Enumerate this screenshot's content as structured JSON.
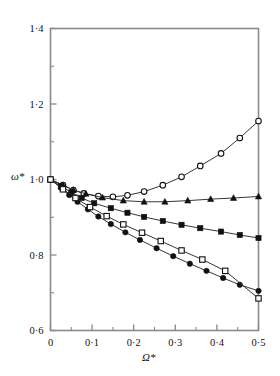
{
  "chart_data": {
    "type": "line",
    "title": "",
    "xlabel": "Ω*",
    "ylabel": "ω*",
    "xlim": [
      0,
      0.5
    ],
    "ylim": [
      0.6,
      1.4
    ],
    "grid": false,
    "legend": "none",
    "x_major_ticks": [
      "0",
      "0·1",
      "0·2",
      "0·3",
      "0·4",
      "0·5"
    ],
    "x_major_values": [
      0,
      0.1,
      0.2,
      0.3,
      0.4,
      0.5
    ],
    "x_minor_values": [
      0.05,
      0.15,
      0.25,
      0.35,
      0.45
    ],
    "y_major_ticks": [
      "0·6",
      "0·8",
      "1·0",
      "1·2",
      "1·4"
    ],
    "y_major_values": [
      0.6,
      0.8,
      1.0,
      1.2,
      1.4
    ],
    "y_minor_values": [
      0.7,
      0.9,
      1.1,
      1.3
    ],
    "series": [
      {
        "name": "open-circle",
        "marker": "circle-open",
        "x": [
          0.0,
          0.03,
          0.055,
          0.08,
          0.115,
          0.15,
          0.185,
          0.225,
          0.27,
          0.315,
          0.36,
          0.41,
          0.455,
          0.5
        ],
        "values": [
          1.0,
          0.985,
          0.972,
          0.963,
          0.956,
          0.954,
          0.958,
          0.968,
          0.985,
          1.007,
          1.036,
          1.069,
          1.11,
          1.155
        ]
      },
      {
        "name": "filled-triangle",
        "marker": "triangle-filled",
        "x": [
          0.0,
          0.03,
          0.055,
          0.085,
          0.125,
          0.175,
          0.225,
          0.275,
          0.33,
          0.385,
          0.44,
          0.5
        ],
        "values": [
          1.0,
          0.985,
          0.972,
          0.962,
          0.952,
          0.944,
          0.941,
          0.941,
          0.944,
          0.948,
          0.951,
          0.955
        ]
      },
      {
        "name": "filled-square",
        "marker": "square-filled",
        "x": [
          0.0,
          0.025,
          0.05,
          0.075,
          0.105,
          0.145,
          0.185,
          0.225,
          0.27,
          0.315,
          0.36,
          0.41,
          0.455,
          0.5
        ],
        "values": [
          1.0,
          0.982,
          0.966,
          0.951,
          0.937,
          0.924,
          0.912,
          0.901,
          0.89,
          0.88,
          0.871,
          0.862,
          0.853,
          0.845
        ]
      },
      {
        "name": "filled-circle",
        "marker": "circle-filled",
        "x": [
          0.0,
          0.025,
          0.045,
          0.065,
          0.09,
          0.115,
          0.145,
          0.18,
          0.215,
          0.255,
          0.295,
          0.335,
          0.375,
          0.415,
          0.455,
          0.5
        ],
        "values": [
          1.0,
          0.978,
          0.959,
          0.941,
          0.921,
          0.902,
          0.882,
          0.86,
          0.84,
          0.818,
          0.797,
          0.777,
          0.758,
          0.739,
          0.721,
          0.705
        ]
      },
      {
        "name": "open-square",
        "marker": "square-open",
        "x": [
          0.0,
          0.03,
          0.06,
          0.095,
          0.135,
          0.175,
          0.22,
          0.265,
          0.315,
          0.365,
          0.42,
          0.5
        ],
        "values": [
          1.0,
          0.974,
          0.951,
          0.927,
          0.903,
          0.881,
          0.859,
          0.837,
          0.812,
          0.788,
          0.758,
          0.685
        ]
      }
    ]
  },
  "plot": {
    "frame_color": "#8a8a8a",
    "line_color": "#2b2b2b",
    "marker_color": "#111111"
  }
}
